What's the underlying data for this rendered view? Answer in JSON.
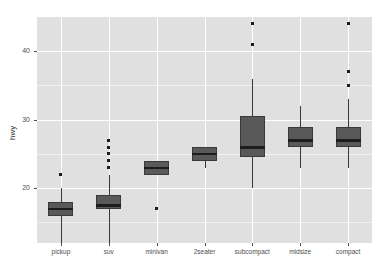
{
  "chart_data": {
    "type": "box",
    "title": "",
    "subtitle": "",
    "xlabel": "",
    "ylabel": "hwy",
    "categories": [
      "pickup",
      "suv",
      "minivan",
      "2seater",
      "subcompact",
      "midsize",
      "compact"
    ],
    "ylim": [
      12,
      45
    ],
    "y_ticks": [
      20,
      30,
      40
    ],
    "y_tick_labels": [
      "20",
      "30",
      "40"
    ],
    "y_minor_ticks": [
      15,
      25,
      35
    ],
    "grid": true,
    "legend": "none",
    "panel_background": "#e0e0e0",
    "grid_color": "#ffffff",
    "box_fill": "#595959",
    "box_border": "#3a3a3a",
    "median_color": "#1c1c1c",
    "outlier_color": "#1c1c1c",
    "boxes": [
      {
        "category": "pickup",
        "lower_whisker": 12,
        "q1": 16,
        "median": 17,
        "q3": 18,
        "upper_whisker": 20,
        "outliers": [
          22
        ]
      },
      {
        "category": "suv",
        "lower_whisker": 12,
        "q1": 17,
        "median": 17.5,
        "q3": 19,
        "upper_whisker": 22,
        "outliers": [
          23,
          24,
          25,
          26,
          27
        ]
      },
      {
        "category": "minivan",
        "lower_whisker": 22,
        "q1": 22,
        "median": 23,
        "q3": 24,
        "upper_whisker": 24,
        "outliers": [
          17
        ]
      },
      {
        "category": "2seater",
        "lower_whisker": 23,
        "q1": 24,
        "median": 25,
        "q3": 26,
        "upper_whisker": 26,
        "outliers": []
      },
      {
        "category": "subcompact",
        "lower_whisker": 20,
        "q1": 24.5,
        "median": 26,
        "q3": 30.5,
        "upper_whisker": 36,
        "outliers": [
          41,
          44
        ]
      },
      {
        "category": "midsize",
        "lower_whisker": 23,
        "q1": 26,
        "median": 27,
        "q3": 29,
        "upper_whisker": 32,
        "outliers": []
      },
      {
        "category": "compact",
        "lower_whisker": 23,
        "q1": 26,
        "median": 27,
        "q3": 29,
        "upper_whisker": 33,
        "outliers": [
          35,
          37,
          44
        ]
      }
    ]
  },
  "axes": {
    "y_title": "hwy",
    "x_title": ""
  }
}
